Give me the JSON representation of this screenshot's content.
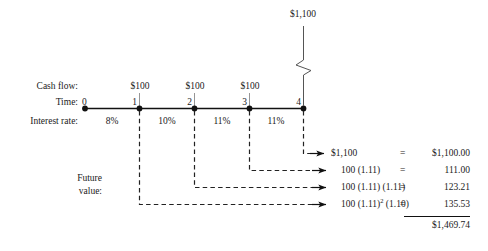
{
  "diagram": {
    "title_value": "$1,100",
    "row_labels": {
      "cash_flow": "Cash flow:",
      "time": "Time:",
      "interest_rate": "Interest rate:",
      "future_value_line1": "Future",
      "future_value_line2": "value:"
    },
    "timeline": {
      "periods": [
        "0",
        "1",
        "2",
        "3",
        "4"
      ],
      "cash_flows": [
        "",
        "$100",
        "$100",
        "$100",
        ""
      ],
      "interest_rates": [
        "8%",
        "10%",
        "11%",
        "11%"
      ]
    },
    "future_value_rows": [
      {
        "formula": "$1,100",
        "formula_sup": "",
        "formula_tail": "",
        "eq": "=",
        "amount": "$1,100.00"
      },
      {
        "formula": "100 (1.11)",
        "formula_sup": "",
        "formula_tail": "",
        "eq": "=",
        "amount": "111.00"
      },
      {
        "formula": "100 (1.11) (1.11)",
        "formula_sup": "",
        "formula_tail": "",
        "eq": "=",
        "amount": "123.21"
      },
      {
        "formula": "100 (1.11)",
        "formula_sup": "2",
        "formula_tail": " (1.10)",
        "eq": "=",
        "amount": "135.53"
      }
    ],
    "total": "$1,469.74",
    "colors": {
      "ink": "#1a1a1a",
      "line": "#000000",
      "dashed": "#222222"
    }
  }
}
